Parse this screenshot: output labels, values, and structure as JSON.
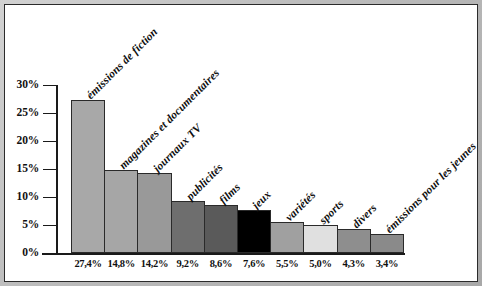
{
  "chart_data": {
    "type": "bar",
    "title": "",
    "subtitle": "",
    "xlabel": "",
    "ylabel": "",
    "ylim": [
      0,
      30
    ],
    "grid": false,
    "legend": "none",
    "orientation": "vertical",
    "categories": [
      "émissions de fiction",
      "magazines et documentaires",
      "journaux TV",
      "publicités",
      "films",
      "jeux",
      "variétés",
      "sports",
      "divers",
      "émissions pour les jeunes"
    ],
    "values": [
      27.4,
      14.8,
      14.2,
      9.2,
      8.6,
      7.6,
      5.5,
      5.0,
      4.3,
      3.4
    ],
    "value_labels": [
      "27,4%",
      "14,8%",
      "14,2%",
      "9,2%",
      "8,6%",
      "7,6%",
      "5,5%",
      "5,0%",
      "4,3%",
      "3,4%"
    ],
    "bar_colors": [
      "#a8a8a8",
      "#a6a6a6",
      "#999999",
      "#6e6e6e",
      "#5a5a5a",
      "#000000",
      "#a0a0a0",
      "#e0e0e0",
      "#8e8e8e",
      "#8a8a8a"
    ],
    "yticks": [
      0,
      5,
      10,
      15,
      20,
      25,
      30
    ],
    "ytick_labels": [
      "0%",
      "5%",
      "10%",
      "15%",
      "20%",
      "25%",
      "30%"
    ],
    "axis_color": "#1a1a1a",
    "bar_border_color": "#2a2a2a",
    "background_color": "#ffffff",
    "frame_color": "#2b2b2b",
    "mat_color": "#c0c0c0"
  }
}
